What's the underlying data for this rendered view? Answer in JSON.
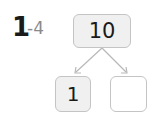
{
  "problem": {
    "number": "1",
    "sub": "-4"
  },
  "number_bond": {
    "whole": "10",
    "parts": [
      "1",
      ""
    ]
  },
  "colors": {
    "box_border": "#c4c4c4",
    "box_fill": "#f0f0f0",
    "arrow": "#b8b8b8",
    "text": "#1a1a1a",
    "sub_text": "#8a8a8a"
  }
}
